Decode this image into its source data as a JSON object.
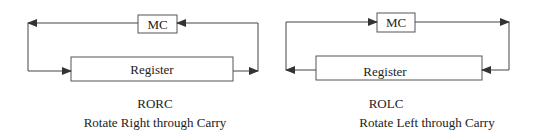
{
  "diagrams": [
    {
      "id": "rorc",
      "mnemonic": "RORC",
      "description": "Rotate Right through Carry",
      "carry_label": "MC",
      "register_label": "Register",
      "direction": "right"
    },
    {
      "id": "rolc",
      "mnemonic": "ROLC",
      "description": "Rotate Left through Carry",
      "carry_label": "MC",
      "register_label": "Register",
      "direction": "left"
    }
  ],
  "colors": {
    "line": "#444444",
    "text": "#222222",
    "background": "#ffffff"
  }
}
